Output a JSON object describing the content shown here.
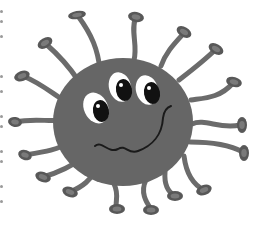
{
  "image": {
    "subject": "Cartoon virus germ creature with three eyes and wavy mouth",
    "width": 262,
    "height": 226,
    "background": "#ffffff"
  },
  "colors": {
    "body": "#666666",
    "tentacle": "#6b6b6b",
    "tentacle_tip": "#585858",
    "tip_highlight": "#7a7a7a",
    "eye_white": "#ffffff",
    "pupil": "#111111",
    "mouth": "#1a1a1a",
    "edge_dot": "#9a9a9a"
  },
  "body": {
    "cx": 123,
    "cy": 122,
    "rx": 70,
    "ry": 64
  },
  "eyes": [
    {
      "name": "left",
      "wx": 96,
      "wy": 108,
      "wrx": 12,
      "wry": 16,
      "wrot": -25,
      "px": 101,
      "py": 111,
      "prx": 8,
      "pry": 11
    },
    {
      "name": "middle",
      "wx": 120,
      "wy": 87,
      "wrx": 11,
      "wry": 15,
      "wrot": -15,
      "px": 124,
      "py": 90,
      "prx": 8,
      "pry": 11
    },
    {
      "name": "right",
      "wx": 147,
      "wy": 90,
      "wrx": 11,
      "wry": 15,
      "wrot": -15,
      "px": 152,
      "py": 93,
      "prx": 8,
      "pry": 11
    }
  ],
  "mouth_path": "M95,146 C102,140 108,154 118,149 C126,144 128,155 138,151 C152,146 162,135 163,118 C164,110 168,107 171,106",
  "tentacles": [
    {
      "d": "M100,70 C98,50 92,35 78,16",
      "tip": [
        77,
        15,
        9,
        4,
        -10
      ]
    },
    {
      "d": "M78,80 C70,68 62,58 46,44",
      "tip": [
        45,
        43,
        8,
        5,
        -30
      ]
    },
    {
      "d": "M60,98 C48,90 38,82 23,76",
      "tip": [
        22,
        76,
        8,
        5,
        -20
      ]
    },
    {
      "d": "M134,60 C138,45 130,30 136,17",
      "tip": [
        136,
        17,
        8,
        5,
        10
      ]
    },
    {
      "d": "M161,66 C166,52 174,44 184,33",
      "tip": [
        184,
        32,
        8,
        5,
        30
      ]
    },
    {
      "d": "M179,80 C192,70 205,60 216,49",
      "tip": [
        216,
        49,
        8,
        5,
        30
      ]
    },
    {
      "d": "M191,100 C205,98 220,98 233,83",
      "tip": [
        234,
        82,
        8,
        5,
        15
      ]
    },
    {
      "d": "M192,124 C205,118 220,130 240,125",
      "tip": [
        242,
        125,
        5,
        8,
        0
      ]
    },
    {
      "d": "M190,142 C210,142 228,144 243,152",
      "tip": [
        244,
        153,
        5,
        8,
        0
      ]
    },
    {
      "d": "M184,156 C186,172 192,184 204,190",
      "tip": [
        204,
        190,
        8,
        5,
        -20
      ]
    },
    {
      "d": "M165,172 C164,185 168,192 175,196",
      "tip": [
        175,
        196,
        8,
        5,
        0
      ]
    },
    {
      "d": "M146,180 C140,192 146,202 151,209",
      "tip": [
        151,
        210,
        8,
        5,
        0
      ]
    },
    {
      "d": "M114,184 C120,196 114,203 117,208",
      "tip": [
        117,
        209,
        8,
        5,
        0
      ]
    },
    {
      "d": "M64,120 C50,122 32,118 16,122",
      "tip": [
        15,
        122,
        7,
        5,
        10
      ]
    },
    {
      "d": "M70,142 C58,150 44,152 25,155",
      "tip": [
        25,
        155,
        7,
        5,
        20
      ]
    },
    {
      "d": "M82,158 C72,166 60,172 43,177",
      "tip": [
        43,
        177,
        8,
        5,
        20
      ]
    },
    {
      "d": "M96,170 C90,180 84,186 70,192",
      "tip": [
        70,
        192,
        8,
        5,
        20
      ]
    }
  ],
  "edge_dots_y": [
    10,
    20,
    35,
    75,
    90,
    115,
    125,
    150,
    160,
    185,
    200
  ]
}
